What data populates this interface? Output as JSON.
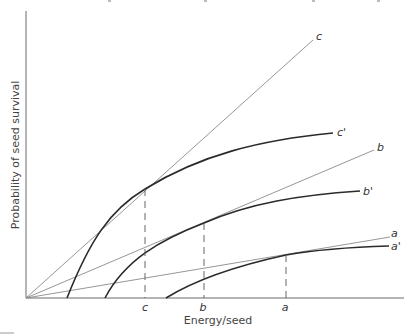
{
  "figure": {
    "x_axis_label": "Energy/seed",
    "y_axis_label": "Probability of seed survival",
    "x_ticks": [
      "c",
      "b",
      "a"
    ],
    "lines": [
      {
        "label": "c",
        "kind": "straight-line"
      },
      {
        "label": "b",
        "kind": "straight-line"
      },
      {
        "label": "a",
        "kind": "straight-line"
      }
    ],
    "curves": [
      {
        "label": "c'",
        "kind": "saturating-curve"
      },
      {
        "label": "b'",
        "kind": "saturating-curve"
      },
      {
        "label": "a'",
        "kind": "saturating-curve"
      }
    ]
  }
}
